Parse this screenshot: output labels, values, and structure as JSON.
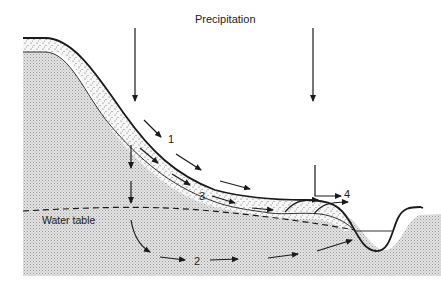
{
  "diagram": {
    "title": "Precipitation",
    "water_table_label": "Water table",
    "flow_labels": [
      "1",
      "2",
      "3",
      "4"
    ],
    "colors": {
      "ink": "#1a1a1a",
      "bedrock_fill": "#d9d9d9",
      "soil_fill": "#ececec",
      "background": "#ffffff"
    }
  }
}
